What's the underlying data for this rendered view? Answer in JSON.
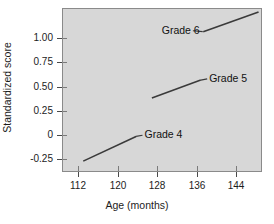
{
  "chart_data": {
    "type": "line",
    "title": "",
    "xlabel": "Age (months)",
    "ylabel": "Standardized score",
    "xlim": [
      108.0,
      148.5
    ],
    "ylim": [
      -0.33,
      1.33
    ],
    "xticks": [
      112,
      120,
      128,
      136,
      144
    ],
    "xtick_labels": [
      "112",
      "120",
      "128",
      "136",
      "144"
    ],
    "yticks": [
      1.0,
      0.75,
      0.5,
      0.25,
      0,
      -0.25
    ],
    "ytick_labels": [
      "1.00",
      "0.75",
      "0.50",
      "0.25",
      "0",
      "-0.25"
    ],
    "grid": false,
    "legend": "inline-labels",
    "plot_background": "#d7d7d7",
    "line_color": "#3a3a3a",
    "series": [
      {
        "name": "Grade 4",
        "label": "Grade 4",
        "x": [
          112.3,
          123.0
        ],
        "values": [
          -0.22,
          0.03
        ],
        "label_x": 124.5,
        "label_y": 0.045,
        "leader_from_x": 123.0,
        "leader_from_y": 0.03,
        "leader_to_x": 124.3,
        "leader_to_y": 0.042
      },
      {
        "name": "Grade 5",
        "label": "Grade 5",
        "x": [
          126.2,
          136.1
        ],
        "values": [
          0.42,
          0.6
        ],
        "label_x": 137.6,
        "label_y": 0.615,
        "leader_from_x": 136.1,
        "leader_from_y": 0.6,
        "leader_to_x": 137.4,
        "leader_to_y": 0.612
      },
      {
        "name": "Grade 6",
        "label": "Grade 6",
        "x": [
          136.6,
          147.8
        ],
        "values": [
          1.09,
          1.29
        ],
        "label_x": 128.0,
        "label_y": 1.1,
        "leader_from_x": 136.5,
        "leader_from_y": 1.09,
        "leader_to_x": 134.5,
        "leader_to_y": 1.1
      }
    ]
  },
  "axes": {
    "ytick_labels": [
      "1.00",
      "0.75",
      "0.50",
      "0.25",
      "0",
      "-0.25"
    ],
    "xtick_labels": [
      "112",
      "120",
      "128",
      "136",
      "144"
    ],
    "ylabel": "Standardized score",
    "xlabel": "Age (months)"
  },
  "labels": {
    "grade4": "Grade 4",
    "grade5": "Grade 5",
    "grade6": "Grade 6"
  }
}
